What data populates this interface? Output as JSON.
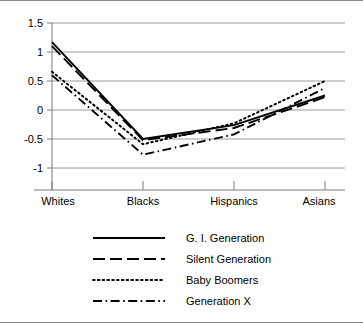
{
  "chart_data": {
    "type": "line",
    "title": "",
    "subtitle": "",
    "xlabel": "",
    "ylabel": "",
    "categories": [
      "Whites",
      "Blacks",
      "Hispanics",
      "Asians"
    ],
    "ylim": [
      -1,
      1.5
    ],
    "yticks": [
      1.5,
      1,
      0.5,
      0,
      -0.5,
      -1
    ],
    "ytick_labels": [
      "1.5",
      "1",
      "0.5",
      "0",
      "-0.5",
      "-1"
    ],
    "grid": true,
    "grid_axis": "y",
    "legend_position": "bottom",
    "series": [
      {
        "name": "G. I. Generation",
        "dash": "solid",
        "color": "#000000",
        "values": [
          1.17,
          -0.5,
          -0.26,
          0.25
        ]
      },
      {
        "name": "Silent Generation",
        "dash": "dashed",
        "color": "#000000",
        "values": [
          1.1,
          -0.52,
          -0.31,
          0.22
        ]
      },
      {
        "name": "Baby Boomers",
        "dash": "dotted",
        "color": "#000000",
        "values": [
          0.66,
          -0.59,
          -0.23,
          0.5
        ]
      },
      {
        "name": "Generation X",
        "dash": "dashdot",
        "color": "#000000",
        "values": [
          0.6,
          -0.77,
          -0.42,
          0.38
        ]
      }
    ]
  },
  "figure": {
    "border_color": "#8a8a8a",
    "grid_color": "#9a9a9a",
    "axis_color": "#7a7a7a",
    "background": "#ffffff"
  }
}
